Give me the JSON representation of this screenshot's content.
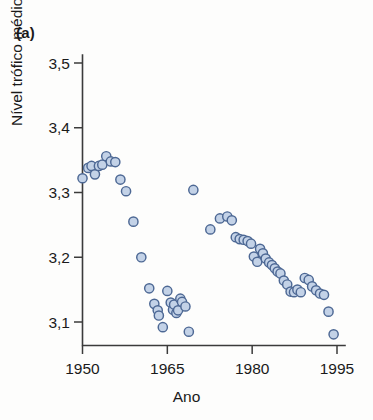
{
  "figure": {
    "panel_label": "(a)",
    "background_color": "#fdfdfc"
  },
  "axes": {
    "x_title": "Ano",
    "y_title": "Nível trófico médio",
    "x_ticks": [
      "1950",
      "1965",
      "1980",
      "1995"
    ],
    "y_ticks": [
      "3,5",
      "3,4",
      "3,3",
      "3,2",
      "3,1"
    ],
    "axis_color": "#3b3b3b"
  },
  "marker_style": {
    "fill_color": "#c3d2e7",
    "edge_color": "#4d6894",
    "radius": 4.6
  },
  "chart_data": {
    "type": "scatter",
    "title": "",
    "subtitle": "",
    "panel": "(a)",
    "xlabel": "Ano",
    "ylabel": "Nível trófico médio",
    "xlim": [
      1948,
      1996
    ],
    "ylim": [
      3.06,
      3.52
    ],
    "xticks": [
      1950,
      1965,
      1980,
      1995
    ],
    "xticklabels": [
      "1950",
      "1965",
      "1980",
      "1995"
    ],
    "yticks": [
      3.1,
      3.2,
      3.3,
      3.4,
      3.5
    ],
    "yticklabels": [
      "3,1",
      "3,2",
      "3,3",
      "3,4",
      "3,5"
    ],
    "grid": false,
    "legend": null,
    "decimal_separator": ",",
    "series": [
      {
        "name": "Nível trófico médio",
        "marker": "circle",
        "fill": "#c3d2e7",
        "edge": "#4d6894",
        "x": [
          1950,
          1951,
          1951.6,
          1952.2,
          1952.9,
          1953.5,
          1954.2,
          1955,
          1955.8,
          1956.7,
          1957.7,
          1959,
          1960.4,
          1961.8,
          1962.7,
          1963.3,
          1963.5,
          1964.2,
          1965,
          1965.6,
          1966,
          1966.2,
          1966.6,
          1966.9,
          1967.3,
          1967.6,
          1968.2,
          1968.8,
          1969.6,
          1972.6,
          1974.3,
          1975.6,
          1976.4,
          1977.1,
          1977.8,
          1978.5,
          1979.2,
          1979.8,
          1980.3,
          1980.9,
          1981.4,
          1981.9,
          1982.4,
          1983,
          1983.5,
          1984,
          1984.5,
          1985,
          1985.6,
          1986.2,
          1986.8,
          1987.4,
          1988,
          1988.6,
          1989.3,
          1990,
          1990.6,
          1991.3,
          1992,
          1992.7,
          1993.5,
          1994.4
        ],
        "y": [
          3.322,
          3.338,
          3.341,
          3.328,
          3.341,
          3.343,
          3.356,
          3.348,
          3.347,
          3.32,
          3.302,
          3.255,
          3.2,
          3.152,
          3.128,
          3.118,
          3.11,
          3.092,
          3.148,
          3.13,
          3.119,
          3.127,
          3.114,
          3.118,
          3.136,
          3.131,
          3.124,
          3.085,
          3.304,
          3.243,
          3.26,
          3.263,
          3.257,
          3.231,
          3.228,
          3.227,
          3.225,
          3.221,
          3.201,
          3.193,
          3.213,
          3.206,
          3.198,
          3.192,
          3.188,
          3.183,
          3.178,
          3.175,
          3.164,
          3.158,
          3.147,
          3.146,
          3.15,
          3.146,
          3.168,
          3.165,
          3.155,
          3.149,
          3.144,
          3.142,
          3.116,
          3.081
        ]
      }
    ]
  }
}
